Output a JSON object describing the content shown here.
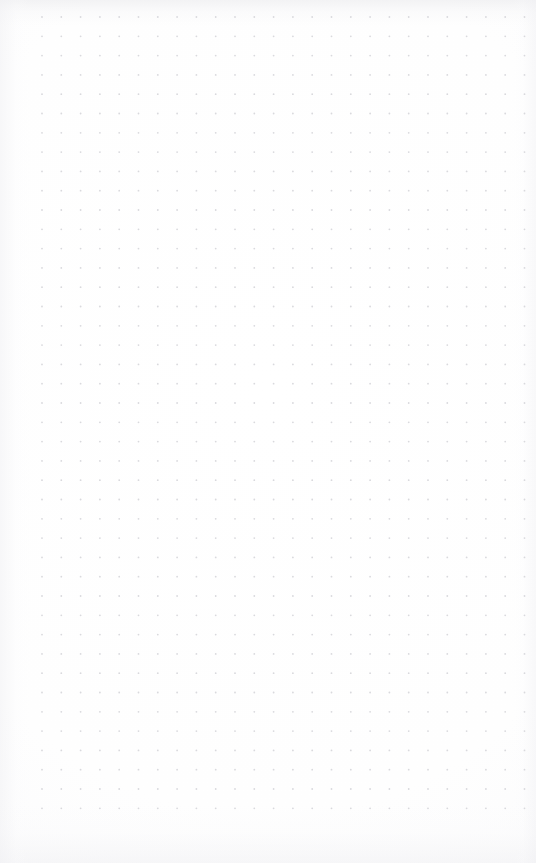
{
  "page": {
    "kind": "dot-grid-notebook-page",
    "width": 536,
    "height": 863,
    "background_color": "#fdfdfd",
    "paper_tint": "#f7f7f8",
    "content_text": "",
    "annotations": []
  },
  "grid": {
    "label": "dot-grid",
    "dot_color": "#d9d9dd",
    "dot_radius": 0.9,
    "spacing_x": 19.3,
    "spacing_y": 19.3,
    "origin_x": 42,
    "origin_y": 17,
    "columns": 26,
    "rows": 42,
    "margin_left": 42,
    "margin_right": 12,
    "margin_top": 17,
    "margin_bottom": 50
  }
}
